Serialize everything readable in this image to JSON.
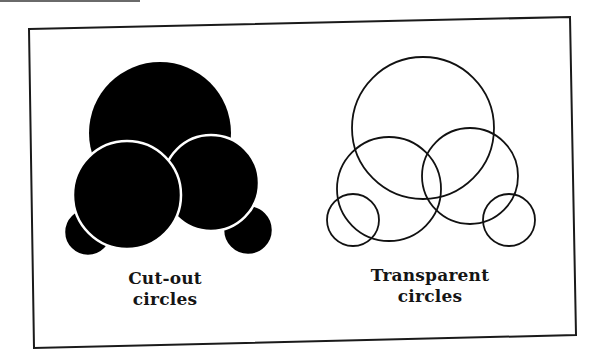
{
  "figure": {
    "frame_color": "#1a1a1a",
    "ink_color": "#000000",
    "background": "#ffffff",
    "left_panel": {
      "caption_line1": "Cut-out",
      "caption_line2": "circles",
      "style": "filled black circles with white separating outlines",
      "circles": [
        {
          "name": "top-large",
          "cx": 160,
          "cy": 133,
          "r": 71
        },
        {
          "name": "bottom-left-small",
          "cx": 88,
          "cy": 232,
          "r": 24
        },
        {
          "name": "bottom-right-small",
          "cx": 248,
          "cy": 230,
          "r": 25
        },
        {
          "name": "middle-right",
          "cx": 211,
          "cy": 183,
          "r": 48
        },
        {
          "name": "middle-left",
          "cx": 127,
          "cy": 195,
          "r": 54
        }
      ]
    },
    "right_panel": {
      "caption_line1": "Transparent",
      "caption_line2": "circles",
      "style": "outlined circles, no fill",
      "circles": [
        {
          "name": "top-large",
          "cx": 423,
          "cy": 128,
          "r": 71
        },
        {
          "name": "middle-left",
          "cx": 389,
          "cy": 189,
          "r": 52
        },
        {
          "name": "middle-right",
          "cx": 470,
          "cy": 176,
          "r": 48
        },
        {
          "name": "bottom-left-small",
          "cx": 353,
          "cy": 220,
          "r": 26
        },
        {
          "name": "bottom-right-small",
          "cx": 509,
          "cy": 220,
          "r": 26
        }
      ]
    }
  }
}
